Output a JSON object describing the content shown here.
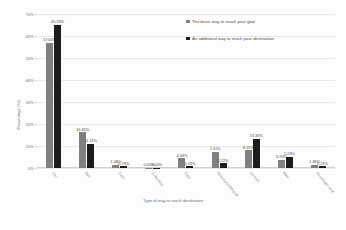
{
  "chart_data": {
    "type": "bar",
    "title": "",
    "xlabel": "Type of way to reach destination",
    "ylabel": "Percentage (%)",
    "ylim": [
      0,
      70
    ],
    "ytick_labels": [
      "0%",
      "10%",
      "20%",
      "30%",
      "40%",
      "50%",
      "60%",
      "70%"
    ],
    "ytick_values": [
      0,
      10,
      20,
      30,
      40,
      50,
      60,
      70
    ],
    "grid": true,
    "legend_position": "top-right",
    "categories": [
      "Car",
      "Bus",
      "Tram",
      "Trolleybus",
      "Train",
      "Motorcycle/Moped",
      "On foot",
      "Bike",
      "Passenger seat"
    ],
    "series": [
      {
        "name": "The basic way to reach your goal",
        "color": "#808080",
        "values": [
          57.04,
          16.3,
          1.48,
          0.0,
          4.44,
          7.41,
          8.15,
          3.7,
          1.48
        ],
        "labels": [
          "57.04%",
          "16.30%",
          "1.48%",
          "0.00%",
          "4.44%",
          "7.41%",
          "8.15%",
          "3.70%",
          "1.48%"
        ]
      },
      {
        "name": "An additional way to reach your destination",
        "color": "#1c1c1c",
        "values": [
          65.19,
          11.11,
          0.74,
          0.0,
          0.74,
          2.22,
          13.33,
          5.19,
          0.74
        ],
        "labels": [
          "65.19%",
          "11.11%",
          "0.74%",
          "0.00%",
          "0.74%",
          "2.22%",
          "13.33%",
          "5.19%",
          "0.74%"
        ]
      }
    ]
  }
}
